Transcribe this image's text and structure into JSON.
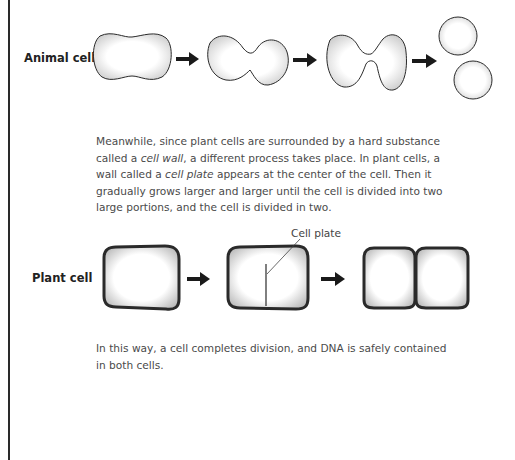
{
  "figure_animal": {
    "label": "Animal cell",
    "stages": [
      "oval cell",
      "pinching cell",
      "nearly divided cell",
      "two daughter cells"
    ]
  },
  "paragraph_1": {
    "part1": "Meanwhile, since plant cells are surrounded by a hard substance called a ",
    "term1": "cell wall",
    "part2": ", a different process takes place. In plant cells, a wall called a ",
    "term2": "cell plate",
    "part3": " appears at the center of the cell. Then it gradually grows larger and larger until the cell is divided into two large portions, and the cell is divided in two."
  },
  "figure_plant": {
    "label": "Plant cell",
    "callout": "Cell plate",
    "stages": [
      "rectangular cell",
      "cell with cell plate",
      "two daughter cells"
    ]
  },
  "paragraph_2": {
    "text": "In this way, a cell completes division, and DNA is safely contained in both cells."
  },
  "colors": {
    "outline": "#2a2a2a",
    "text": "#4a4a4a",
    "label": "#222222"
  }
}
